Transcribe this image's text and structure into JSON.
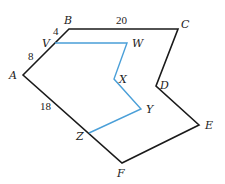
{
  "diagram": {
    "type": "polygon-with-inner-path",
    "colors": {
      "outline": "#1a1a1a",
      "inner_path": "#4a9fd8",
      "background": "#ffffff"
    },
    "vertices": {
      "A": {
        "label": "A",
        "x": 23,
        "y": 75
      },
      "B": {
        "label": "B",
        "x": 69,
        "y": 29
      },
      "C": {
        "label": "C",
        "x": 178,
        "y": 29
      },
      "D": {
        "label": "D",
        "x": 156,
        "y": 86
      },
      "E": {
        "label": "E",
        "x": 199,
        "y": 125
      },
      "F": {
        "label": "F",
        "x": 122,
        "y": 163
      }
    },
    "path_points": {
      "V": {
        "label": "V",
        "x": 55,
        "y": 43
      },
      "W": {
        "label": "W",
        "x": 127,
        "y": 43
      },
      "X": {
        "label": "X",
        "x": 114,
        "y": 79
      },
      "Y": {
        "label": "Y",
        "x": 141,
        "y": 109
      },
      "Z": {
        "label": "Z",
        "x": 89,
        "y": 133
      }
    },
    "measurements": {
      "BV": "4",
      "VA": "8",
      "BC": "20",
      "AF": "18"
    }
  }
}
